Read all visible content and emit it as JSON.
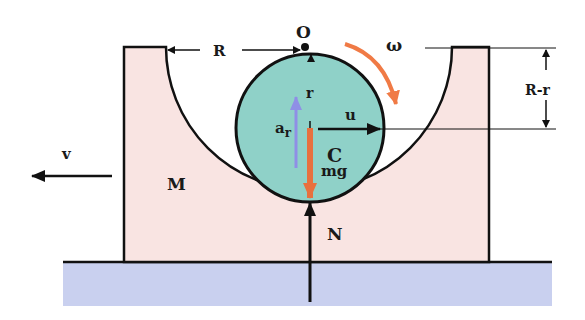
{
  "labels": {
    "O": "O",
    "R": "R",
    "omega": "ω",
    "R_minus_r": "R-r",
    "r": "r",
    "u": "u",
    "a_r_main": "a",
    "a_r_sub": "r",
    "C": "C",
    "mg": "mg",
    "v": "v",
    "M": "M",
    "N": "N"
  },
  "colors": {
    "block_fill": "#f9e4e2",
    "ball_fill": "#8fd1c8",
    "floor_fill": "#c9d0ef",
    "outline": "#111111",
    "omega_arrow": "#f07a45",
    "mg_arrow": "#e8703f",
    "ar_arrow": "#8f8fe6"
  }
}
